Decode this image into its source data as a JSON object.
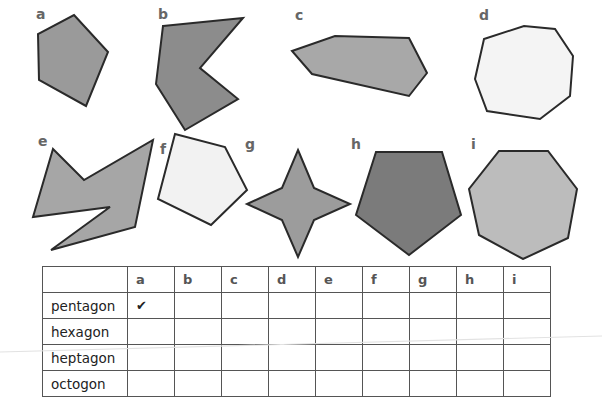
{
  "worksheet": {
    "shapes": [
      {
        "id": "a",
        "label": "a",
        "fill": "#9a9a9a",
        "points": "74,15 108,52 86,106 39,80 38,34",
        "label_pos": [
          36,
          7
        ]
      },
      {
        "id": "b",
        "label": "b",
        "fill": "#8c8c8c",
        "points": "163,26 243,18 200,68 238,99 185,130 156,84",
        "label_pos": [
          158,
          7
        ]
      },
      {
        "id": "c",
        "label": "c",
        "fill": "#a8a8a8",
        "points": "292,51 335,36 409,38 427,73 409,96 312,74",
        "label_pos": [
          295,
          8
        ]
      },
      {
        "id": "d",
        "label": "d",
        "fill": "#f4f4f4",
        "points": "484,39 524,26 555,29 573,56 570,96 540,119 487,111 475,79",
        "label_pos": [
          479,
          8
        ]
      },
      {
        "id": "e",
        "label": "e",
        "fill": "#a6a6a6",
        "points": "53,149 84,180 153,140 135,227 51,250 110,207 33,217",
        "label_pos": [
          38,
          134
        ]
      },
      {
        "id": "f",
        "label": "f",
        "fill": "#f2f2f2",
        "points": "175,134 225,147 247,190 211,225 158,199",
        "label_pos": [
          160,
          142
        ]
      },
      {
        "id": "g",
        "label": "g",
        "fill": "#9c9c9c",
        "points": "298,150 314,188 350,204 314,220 298,257 282,220 247,204 282,188",
        "label_pos": [
          245,
          137
        ]
      },
      {
        "id": "h",
        "label": "h",
        "fill": "#7b7b7b",
        "points": "376,152 442,152 461,215 409,255 356,215",
        "label_pos": [
          351,
          137
        ]
      },
      {
        "id": "i",
        "label": "i",
        "fill": "#bcbcbc",
        "points": "499,151 548,151 577,189 568,238 523,259 479,235 469,189",
        "label_pos": [
          470,
          137
        ]
      }
    ],
    "stroke_color": "#2a2a2a"
  },
  "table": {
    "columns": [
      "",
      "a",
      "b",
      "c",
      "d",
      "e",
      "f",
      "g",
      "h",
      "i"
    ],
    "rows": [
      {
        "name": "pentagon",
        "cells": [
          "✔",
          "",
          "",
          "",
          "",
          "",
          "",
          "",
          ""
        ]
      },
      {
        "name": "hexagon",
        "cells": [
          "",
          "",
          "",
          "",
          "",
          "",
          "",
          "",
          ""
        ]
      },
      {
        "name": "heptagon",
        "cells": [
          "",
          "",
          "",
          "",
          "",
          "",
          "",
          "",
          ""
        ]
      },
      {
        "name": "octogon",
        "cells": [
          "",
          "",
          "",
          "",
          "",
          "",
          "",
          "",
          ""
        ]
      }
    ]
  }
}
